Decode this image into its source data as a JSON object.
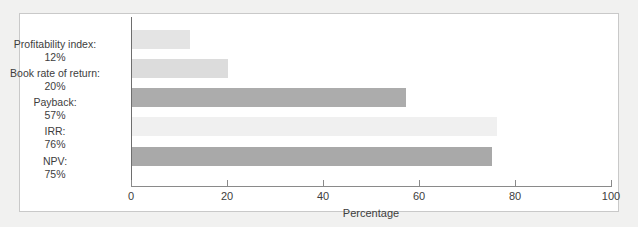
{
  "figure": {
    "background_color": "#f1f1f0",
    "panel_color": "#ffffff",
    "border_color": "#c9c9c9"
  },
  "chart_data": {
    "type": "bar",
    "orientation": "horizontal",
    "title": "",
    "subtitle": "",
    "xlabel": "Percentage",
    "ylabel": "",
    "categories": [
      "Profitability index:",
      "Book rate of return:",
      "Payback:",
      "IRR:",
      "NPV:"
    ],
    "category_values": [
      "12%",
      "20%",
      "57%",
      "76%",
      "75%"
    ],
    "values": [
      12,
      20,
      57,
      76,
      75
    ],
    "xlim": [
      0,
      100
    ],
    "xticks": [
      0,
      20,
      40,
      60,
      80,
      100
    ],
    "xtick_labels": [
      "0",
      "20",
      "40",
      "60",
      "80",
      "100"
    ],
    "grid": false,
    "legend": null,
    "bar_colors": [
      "#e4e4e4",
      "#dcdcdc",
      "#acacac",
      "#f0f0f0",
      "#a9a9a9"
    ],
    "axis_color": "#8a8a8a"
  }
}
